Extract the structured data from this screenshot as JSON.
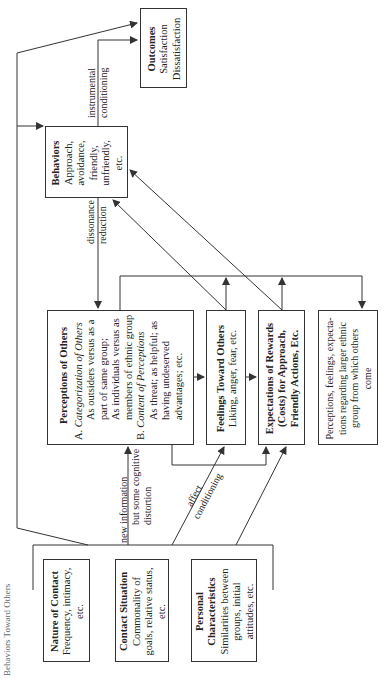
{
  "header": {
    "partial_title": "Behaviors Toward Others"
  },
  "boxes": {
    "outcomes": {
      "title": "Outcomes",
      "lines": [
        "Satisfaction",
        "Dissatisfaction"
      ]
    },
    "behaviors": {
      "title": "Behaviors",
      "lines": [
        "Approach,",
        "avoidance,",
        "friendly,",
        "unfriendly,",
        "etc."
      ]
    },
    "perceptions": {
      "title": "Perceptions of Others",
      "a_label": "A.",
      "a_heading": "Categorization of Others",
      "a_items": [
        "As outsiders versus as a",
        "part of same group;",
        "As individuals versus as",
        "members of ethnic group"
      ],
      "b_label": "B.",
      "b_heading": "Content of Perceptions",
      "b_items": [
        "As threat; as helpful; as",
        "having undeserved",
        "advantages; etc."
      ]
    },
    "feelings": {
      "title": "Feelings Toward Others",
      "text": "Liking, anger, fear, etc."
    },
    "expectations": {
      "title_lines": [
        "Expectations of Rewards",
        "(Costs) for Approach,",
        "Friendly Actions, Etc."
      ]
    },
    "larger_group": {
      "lines": [
        "Perceptions, feelings, expecta-",
        "tions regarding larger ethnic",
        "group from which others",
        "come"
      ]
    },
    "nature_of_contact": {
      "title": "Nature of Contact",
      "lines": [
        "Frequency, intimacy,",
        "etc."
      ]
    },
    "contact_situation": {
      "title": "Contact Situation",
      "lines": [
        "Commonality of",
        "goals, relative status,",
        "etc."
      ]
    },
    "personal_characteristics": {
      "title_lines": [
        "Personal",
        "Characteristics"
      ],
      "lines": [
        "Similarities between",
        "groups, initial",
        "attitudes, etc."
      ]
    }
  },
  "labels": {
    "instrumental": [
      "instrumental",
      "conditioning"
    ],
    "dissonance": [
      "dissonance",
      "reduction"
    ],
    "new_info": [
      "new information",
      "but some cognitive",
      "distortion"
    ],
    "affect": [
      "affect",
      "conditioning"
    ]
  },
  "colors": {
    "line": "#333333",
    "text": "#222222",
    "background": "#ffffff"
  }
}
